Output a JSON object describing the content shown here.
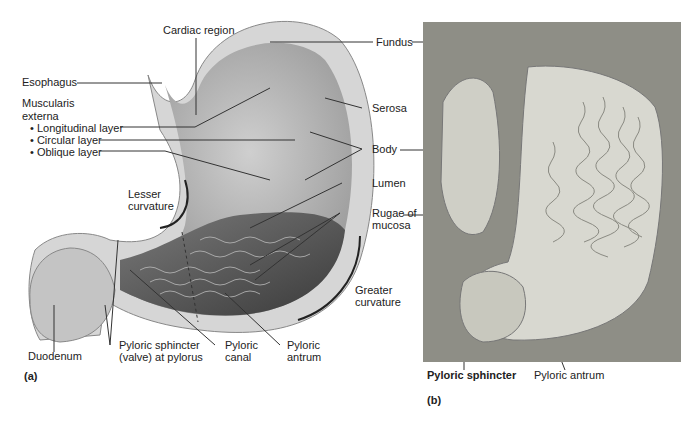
{
  "panel_a": {
    "caption": "(a)",
    "labels": {
      "cardiac_region": "Cardiac region",
      "esophagus": "Esophagus",
      "muscularis_1": "Muscularis",
      "muscularis_2": "externa",
      "longitudinal": "• Longitudinal layer",
      "circular": "• Circular layer",
      "oblique": "• Oblique layer",
      "lesser_1": "Lesser",
      "lesser_2": "curvature",
      "fundus": "Fundus",
      "serosa": "Serosa",
      "body": "Body",
      "lumen": "Lumen",
      "rugae_1": "Rugae of",
      "rugae_2": "mucosa",
      "greater_1": "Greater",
      "greater_2": "curvature",
      "duodenum": "Duodenum",
      "pyloric_sphincter_1": "Pyloric sphincter",
      "pyloric_sphincter_2": "(valve) at pylorus",
      "pyloric_canal_1": "Pyloric",
      "pyloric_canal_2": "canal",
      "pyloric_antrum_1": "Pyloric",
      "pyloric_antrum_2": "antrum"
    }
  },
  "panel_b": {
    "caption": "(b)",
    "labels": {
      "pyloric_sphincter": "Pyloric sphincter",
      "pyloric_antrum": "Pyloric antrum"
    }
  }
}
